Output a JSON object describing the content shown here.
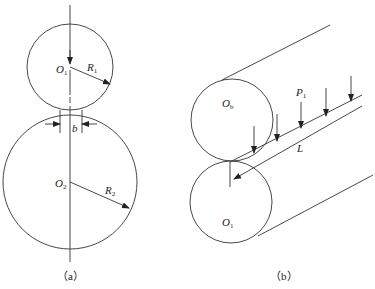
{
  "figure_a": {
    "caption": "（a）",
    "upper_roller": {
      "center_label": "O",
      "center_sub": "1",
      "radius_label": "R",
      "radius_sub": "1"
    },
    "lower_roller": {
      "center_label": "O",
      "center_sub": "2",
      "radius_label": "R",
      "radius_sub": "2"
    },
    "contact_width_label": "b"
  },
  "figure_b": {
    "caption": "（b）",
    "upper_roller": {
      "center_label": "O",
      "center_sub": "b"
    },
    "lower_roller": {
      "center_label": "O",
      "center_sub": "1"
    },
    "load_label": "P",
    "load_sub": "1",
    "length_label": "L"
  },
  "colors": {
    "line": "#333333",
    "background": "#ffffff"
  }
}
